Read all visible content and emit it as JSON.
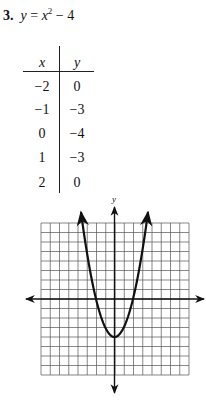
{
  "problem": {
    "number": "3.",
    "equation_lhs": "y",
    "equation_eq": " = ",
    "equation_var": "x",
    "equation_exp": "2",
    "equation_rest": " − 4"
  },
  "table": {
    "headers": [
      "x",
      "y"
    ],
    "rows": [
      {
        "x": "−2",
        "y": "0"
      },
      {
        "x": "−1",
        "y": "−3"
      },
      {
        "x": "0",
        "y": "−4"
      },
      {
        "x": "1",
        "y": "−3"
      },
      {
        "x": "2",
        "y": "0"
      }
    ]
  },
  "graph": {
    "y_axis_label": "y"
  },
  "chart_data": {
    "type": "line",
    "xlabel": "",
    "ylabel": "y",
    "function": "y = x^2 - 4",
    "table": {
      "x": [
        -2,
        -1,
        0,
        1,
        2
      ],
      "y": [
        0,
        -3,
        -4,
        -3,
        0
      ]
    },
    "series": [
      {
        "name": "y = x^2 - 4",
        "x": [
          -2,
          -1,
          0,
          1,
          2
        ],
        "values": [
          0,
          -3,
          -4,
          -3,
          0
        ]
      }
    ],
    "xlim": [
      -8,
      8
    ],
    "ylim": [
      -8,
      8
    ],
    "grid": true,
    "grid_cells": {
      "columns": 16,
      "rows": 16
    },
    "vertex": [
      0,
      -4
    ],
    "x_intercepts": [
      -2,
      2
    ],
    "arrows": "both axes and both parabola ends",
    "tick_labels": "none"
  }
}
